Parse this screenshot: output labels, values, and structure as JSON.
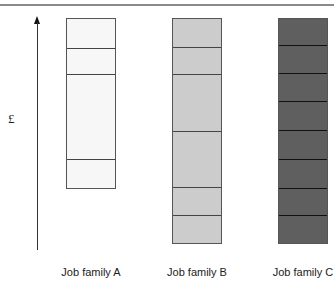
{
  "axis": {
    "y_label": "£",
    "arrow": "up-arrow"
  },
  "chart_data": {
    "type": "bar",
    "title": "",
    "xlabel": "",
    "ylabel": "£",
    "categories": [
      "Job family A",
      "Job family B",
      "Job family C"
    ],
    "bars": [
      {
        "name": "Job family A",
        "color": "#f7f7f7",
        "top_px": 18,
        "bottom_px": 189,
        "dividers_px": [
          48,
          74,
          159
        ],
        "band_count": 4
      },
      {
        "name": "Job family B",
        "color": "#cccccc",
        "top_px": 18,
        "bottom_px": 244,
        "dividers_px": [
          47,
          74,
          131,
          187,
          215
        ],
        "band_count": 6
      },
      {
        "name": "Job family C",
        "color": "#5f5f5f",
        "top_px": 18,
        "bottom_px": 244,
        "dividers_px": [
          45,
          73,
          101,
          130,
          159,
          188,
          215
        ],
        "band_count": 8
      }
    ],
    "grid": false,
    "legend": null
  },
  "labels": {
    "a": "Job family A",
    "b": "Job family B",
    "c": "Job family C"
  }
}
